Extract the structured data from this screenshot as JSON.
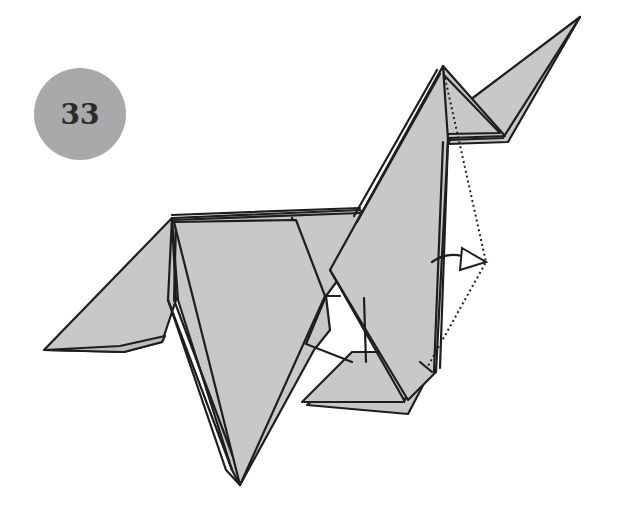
{
  "diagram": {
    "type": "origami-step",
    "step_number": "33",
    "colors": {
      "paper": "#c8c8c8",
      "outline": "#1e1e1e",
      "badge": "#a9a9a9",
      "badge_text": "#2b2b2b",
      "background": "#ffffff"
    },
    "annotations": [
      {
        "kind": "dotted-fold-line",
        "description": "valley fold guide from head tip to lower leg"
      },
      {
        "kind": "hollow-arrow",
        "description": "fold the neck edge outward to the right"
      }
    ]
  }
}
